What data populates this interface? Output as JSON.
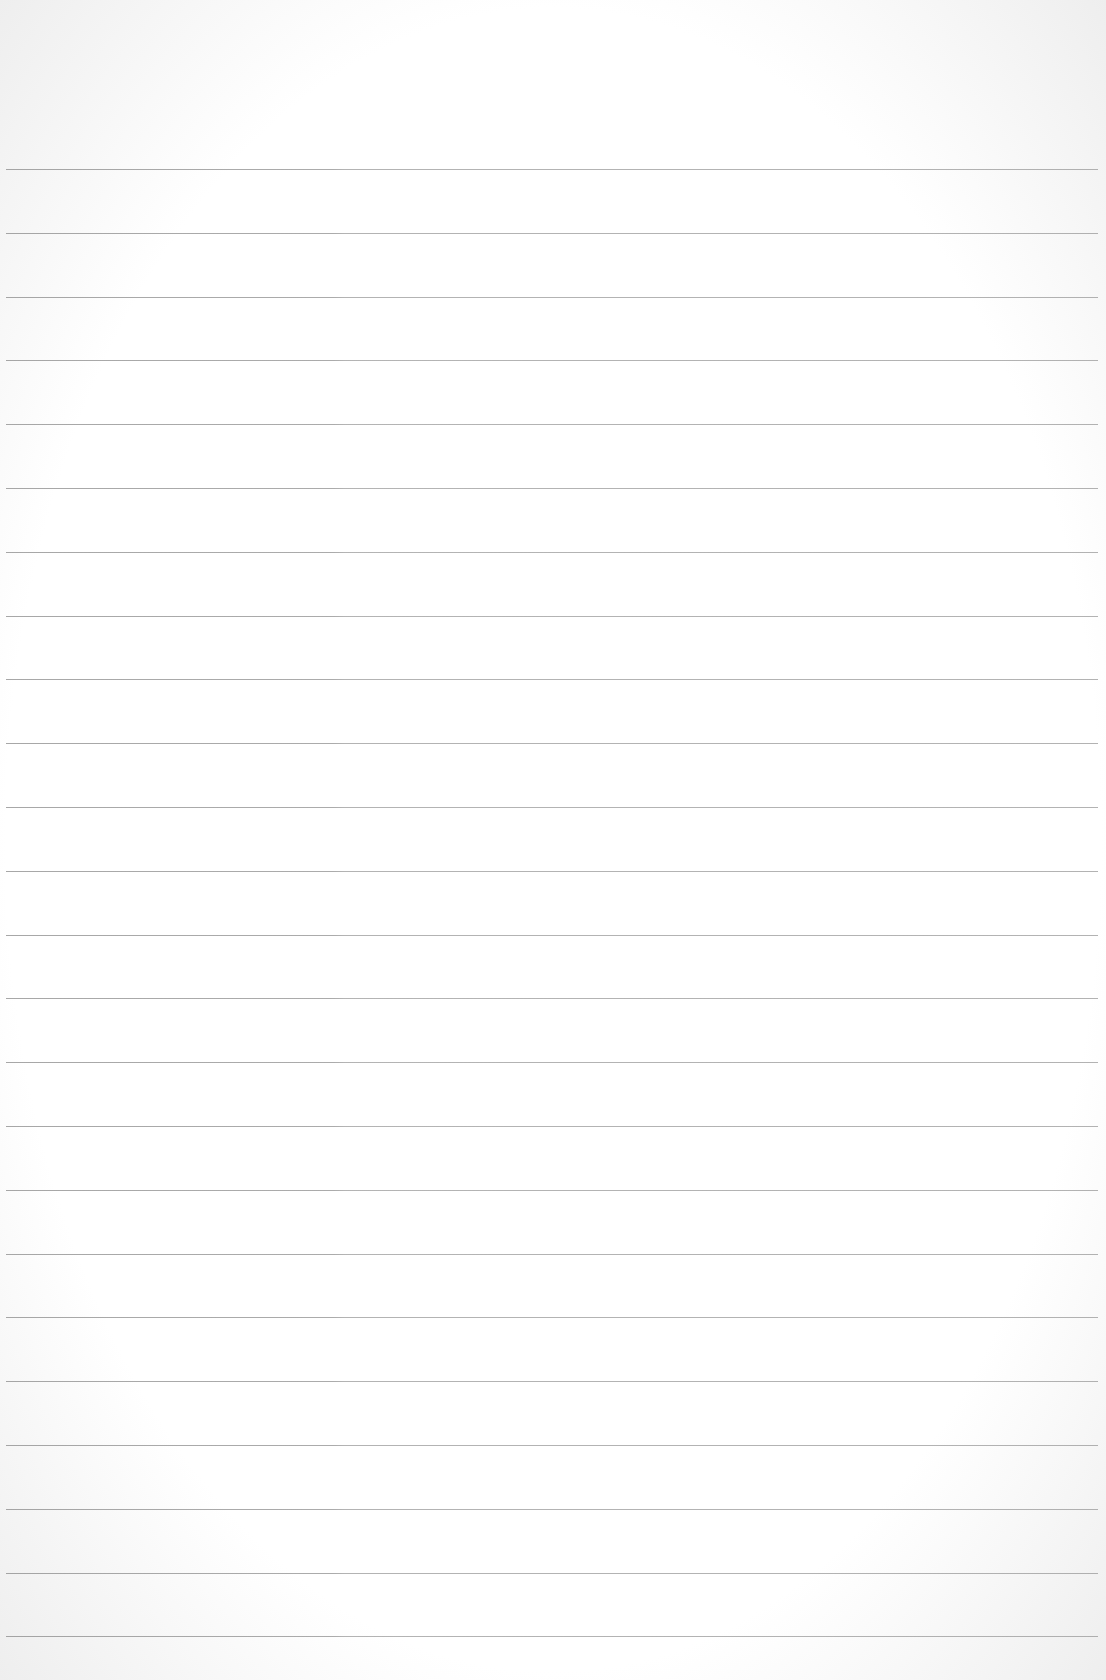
{
  "page": {
    "type": "lined-paper",
    "background_color": "#ffffff",
    "rule_color": "#8f8f8f",
    "rule_count": 24,
    "first_rule_y": 169,
    "rule_spacing": 63.8
  }
}
